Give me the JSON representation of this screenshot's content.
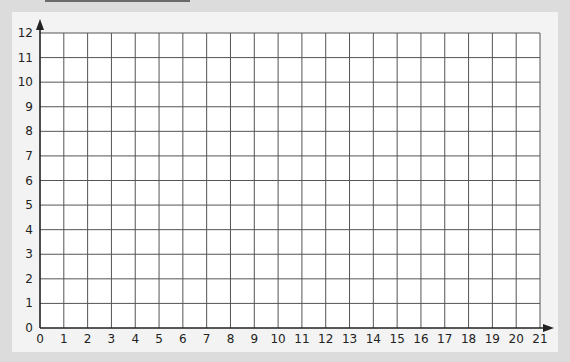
{
  "chart_data": {
    "type": "grid",
    "title": "",
    "xlabel": "",
    "ylabel": "",
    "xlim": [
      0,
      21
    ],
    "ylim": [
      0,
      12
    ],
    "grid": true,
    "x_ticks": [
      "0",
      "1",
      "2",
      "3",
      "4",
      "5",
      "6",
      "7",
      "8",
      "9",
      "10",
      "11",
      "12",
      "13",
      "14",
      "15",
      "16",
      "17",
      "18",
      "19",
      "20",
      "21"
    ],
    "y_ticks": [
      "0",
      "1",
      "2",
      "3",
      "4",
      "5",
      "6",
      "7",
      "8",
      "9",
      "10",
      "11",
      "12"
    ],
    "series": [],
    "axis_arrows": {
      "x": true,
      "y": true
    }
  },
  "colors": {
    "background": "#dcdcdc",
    "panel": "#f3f3f3",
    "plot": "#ffffff",
    "grid": "#555555",
    "axis": "#222222"
  }
}
